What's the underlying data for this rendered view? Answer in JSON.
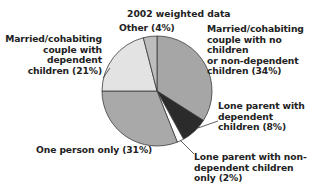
{
  "chart_data": {
    "type": "pie",
    "title": "2002 weighted data",
    "start_angle_deg": 0,
    "direction": "clockwise",
    "slices": [
      {
        "label": "Married/cohabiting couple with no children or non-dependent children",
        "value": 34,
        "display": "Married/cohabiting\ncouple with no children\nor non-dependent\nchildren (34%)",
        "color": "#a6a6a6"
      },
      {
        "label": "Lone parent with dependent children",
        "value": 8,
        "display": "Lone parent with\ndependent\nchildren (8%)",
        "color": "#2b2b2b"
      },
      {
        "label": "Lone parent with non-dependent children only",
        "value": 2,
        "display": "Lone parent with non-\ndependent children\nonly (2%)",
        "color": "#ffffff"
      },
      {
        "label": "One person only",
        "value": 31,
        "display": "One person only (31%)",
        "color": "#a9a9a9"
      },
      {
        "label": "Married/cohabiting couple with dependent children",
        "value": 21,
        "display": "Married/cohabiting\ncouple with\ndependent\nchildren (21%)",
        "color": "#e3e3e3"
      },
      {
        "label": "Other",
        "value": 4,
        "display": "Other (4%)",
        "color": "#bdbdbd"
      }
    ],
    "legend": "none (direct labels with leader lines)",
    "units": "%"
  },
  "labels": {
    "title": "2002 weighted data",
    "other": "Other (4%)",
    "couple_no_children": "Married/cohabiting\ncouple with no children\nor non-dependent\nchildren (34%)",
    "couple_dependent": "Married/cohabiting\ncouple with\ndependent\nchildren (21%)",
    "lone_dependent": "Lone parent with\ndependent\nchildren (8%)",
    "lone_nondependent": "Lone parent with non-\ndependent children\nonly (2%)",
    "one_person": "One person only (31%)"
  },
  "colors": {
    "outline": "#3a3a3a",
    "background": "#ffffff"
  }
}
